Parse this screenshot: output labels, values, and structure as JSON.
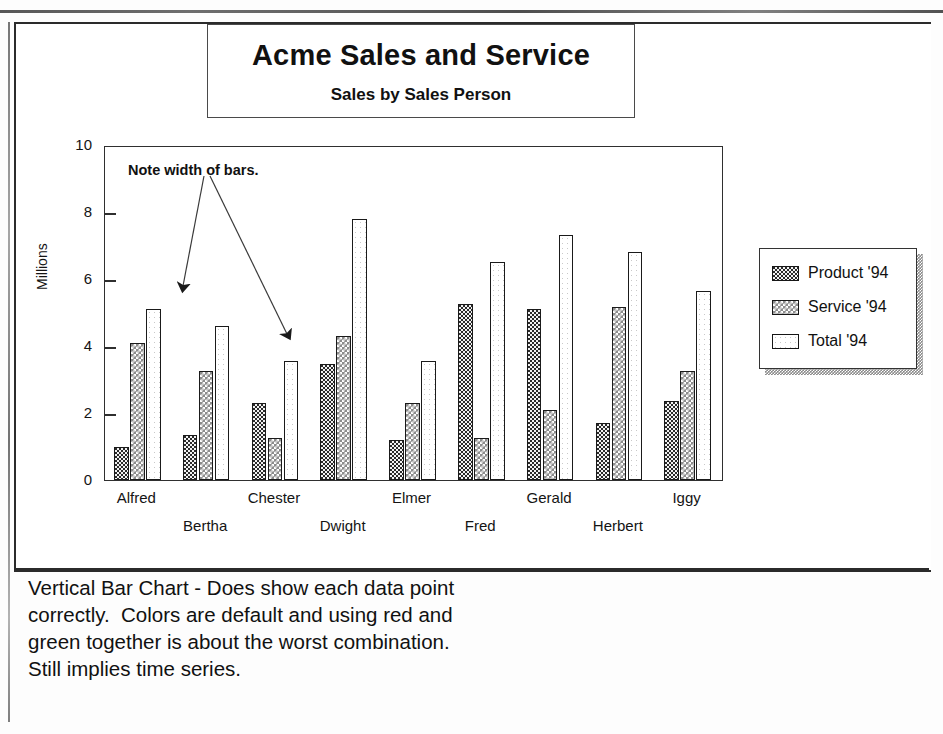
{
  "title": {
    "main": "Acme Sales and Service",
    "sub": "Sales by Sales Person"
  },
  "annotation": {
    "text": "Note width of bars."
  },
  "axis": {
    "y_title": "Millions",
    "y_ticks": [
      "10",
      "8",
      "6",
      "4",
      "2",
      "0"
    ]
  },
  "legend": {
    "items": [
      {
        "label": "Product '94",
        "swatch": "dark-checker-swatch"
      },
      {
        "label": "Service '94",
        "swatch": "light-checker-swatch"
      },
      {
        "label": "Total '94",
        "swatch": "empty-swatch"
      }
    ]
  },
  "caption": {
    "lines": [
      "Vertical Bar Chart - Does show each data point",
      "correctly.  Colors are default and using red and",
      "green together is about the worst combination.",
      "Still implies time series."
    ]
  },
  "chart_data": {
    "type": "bar",
    "title": "Acme Sales and Service",
    "subtitle": "Sales by Sales Person",
    "xlabel": "",
    "ylabel": "Millions",
    "ylim": [
      0,
      10
    ],
    "ytick_values": [
      0,
      2,
      4,
      6,
      8,
      10
    ],
    "grid": false,
    "legend_position": "right",
    "annotations": [
      "Note width of bars."
    ],
    "categories": [
      "Alfred",
      "Bertha",
      "Chester",
      "Dwight",
      "Elmer",
      "Fred",
      "Gerald",
      "Herbert",
      "Iggy"
    ],
    "series": [
      {
        "name": "Product '94",
        "values": [
          1.0,
          1.35,
          2.3,
          3.45,
          1.2,
          5.25,
          5.1,
          1.7,
          2.35
        ]
      },
      {
        "name": "Service '94",
        "values": [
          4.1,
          3.25,
          1.25,
          4.3,
          2.3,
          1.25,
          2.1,
          5.15,
          3.25
        ]
      },
      {
        "name": "Total '94",
        "values": [
          5.1,
          4.6,
          3.55,
          7.8,
          3.55,
          6.5,
          7.3,
          6.8,
          5.65
        ]
      }
    ]
  }
}
